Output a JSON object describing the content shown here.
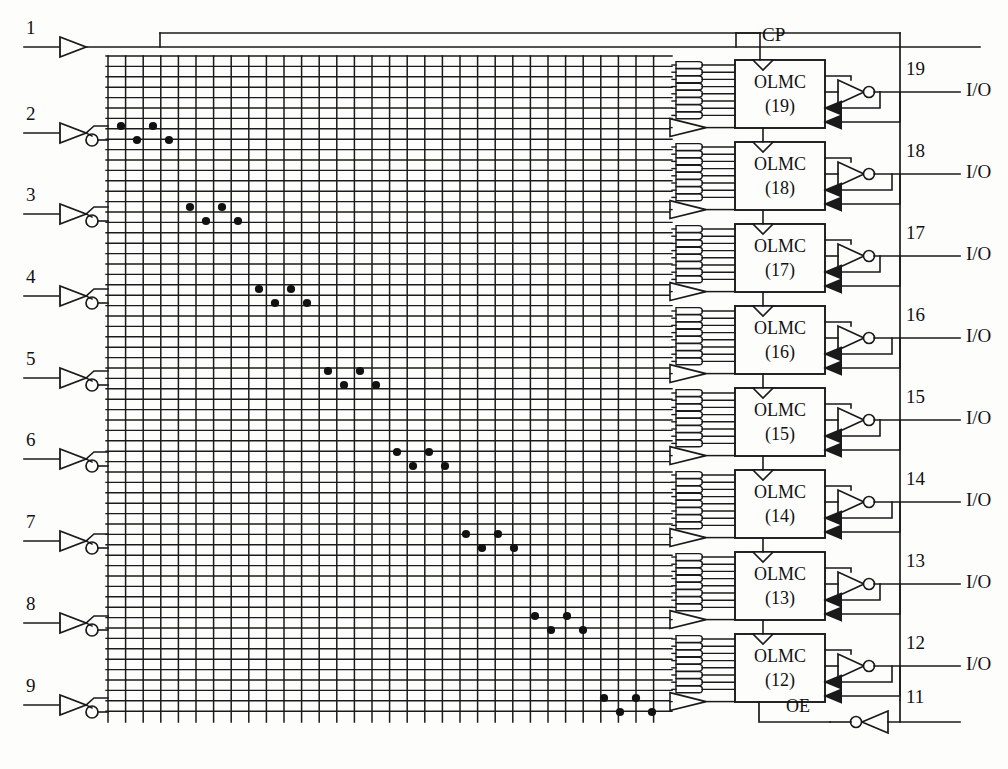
{
  "diagram": {
    "type": "logic-schematic",
    "stroke_color": "#1a1a1a",
    "background_color": "#fdfdfc",
    "clock_label": "CP",
    "output_enable_label": "OE",
    "io_label": "I/O",
    "olmc_prefix": "OLMC",
    "input_pins": [
      {
        "number": "1",
        "y": 47,
        "kind": "clock-buffer",
        "inverted": false
      },
      {
        "number": "2",
        "y": 133,
        "kind": "input-buffer",
        "inverted": true
      },
      {
        "number": "3",
        "y": 214,
        "kind": "input-buffer",
        "inverted": true
      },
      {
        "number": "4",
        "y": 296,
        "kind": "input-buffer",
        "inverted": true
      },
      {
        "number": "5",
        "y": 378,
        "kind": "input-buffer",
        "inverted": true
      },
      {
        "number": "6",
        "y": 459,
        "kind": "input-buffer",
        "inverted": true
      },
      {
        "number": "7",
        "y": 541,
        "kind": "input-buffer",
        "inverted": true
      },
      {
        "number": "8",
        "y": 623,
        "kind": "input-buffer",
        "inverted": true
      },
      {
        "number": "9",
        "y": 705,
        "kind": "input-buffer",
        "inverted": true
      }
    ],
    "olmc_cells": [
      {
        "number": "19",
        "pin": "19",
        "io": "I/O",
        "y": 60,
        "has_clock_input": true
      },
      {
        "number": "18",
        "pin": "18",
        "io": "I/O",
        "y": 142,
        "has_clock_input": true
      },
      {
        "number": "17",
        "pin": "17",
        "io": "I/O",
        "y": 224,
        "has_clock_input": true
      },
      {
        "number": "16",
        "pin": "16",
        "io": "I/O",
        "y": 306,
        "has_clock_input": true
      },
      {
        "number": "15",
        "pin": "15",
        "io": "I/O",
        "y": 388,
        "has_clock_input": true
      },
      {
        "number": "14",
        "pin": "14",
        "io": "I/O",
        "y": 470,
        "has_clock_input": true
      },
      {
        "number": "13",
        "pin": "13",
        "io": "I/O",
        "y": 552,
        "has_clock_input": true
      },
      {
        "number": "12",
        "pin": "12",
        "io": "I/O",
        "y": 634,
        "has_clock_input": true
      }
    ],
    "oe_pin": {
      "number": "11",
      "label": "OE",
      "y": 722
    },
    "matrix": {
      "x0": 108,
      "x1": 672,
      "y0": 56,
      "y1": 722,
      "column_count": 32,
      "column_spacing": 17.6,
      "row_count": 64,
      "row_spacing": 10.4,
      "fuse_dots_per_pin": 4,
      "note": "programmable AND-array; dots mark intact fuse links"
    },
    "and_gates_per_cell": 8,
    "fuse_dot_rows": [
      {
        "pin": "2",
        "dots": [
          {
            "x": 121,
            "row": "true"
          },
          {
            "x": 137,
            "row": "comp"
          },
          {
            "x": 153,
            "row": "true"
          },
          {
            "x": 169,
            "row": "comp"
          }
        ]
      },
      {
        "pin": "3",
        "dots": [
          {
            "x": 190,
            "row": "true"
          },
          {
            "x": 206,
            "row": "comp"
          },
          {
            "x": 222,
            "row": "true"
          },
          {
            "x": 238,
            "row": "comp"
          }
        ]
      },
      {
        "pin": "4",
        "dots": [
          {
            "x": 259,
            "row": "true"
          },
          {
            "x": 275,
            "row": "comp"
          },
          {
            "x": 291,
            "row": "true"
          },
          {
            "x": 307,
            "row": "comp"
          }
        ]
      },
      {
        "pin": "5",
        "dots": [
          {
            "x": 328,
            "row": "true"
          },
          {
            "x": 344,
            "row": "comp"
          },
          {
            "x": 360,
            "row": "true"
          },
          {
            "x": 376,
            "row": "comp"
          }
        ]
      },
      {
        "pin": "6",
        "dots": [
          {
            "x": 397,
            "row": "true"
          },
          {
            "x": 413,
            "row": "comp"
          },
          {
            "x": 429,
            "row": "true"
          },
          {
            "x": 445,
            "row": "comp"
          }
        ]
      },
      {
        "pin": "7",
        "dots": [
          {
            "x": 466,
            "row": "true"
          },
          {
            "x": 482,
            "row": "comp"
          },
          {
            "x": 498,
            "row": "true"
          },
          {
            "x": 514,
            "row": "comp"
          }
        ]
      },
      {
        "pin": "8",
        "dots": [
          {
            "x": 535,
            "row": "true"
          },
          {
            "x": 551,
            "row": "comp"
          },
          {
            "x": 567,
            "row": "true"
          },
          {
            "x": 583,
            "row": "comp"
          }
        ]
      },
      {
        "pin": "9",
        "dots": [
          {
            "x": 604,
            "row": "true"
          },
          {
            "x": 620,
            "row": "comp"
          },
          {
            "x": 636,
            "row": "true"
          },
          {
            "x": 652,
            "row": "comp"
          }
        ]
      }
    ],
    "caption": "　　　　　"
  }
}
